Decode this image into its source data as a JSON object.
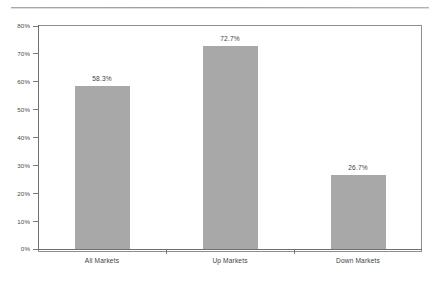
{
  "chart_data": {
    "type": "bar",
    "title": "",
    "subtitle": "",
    "xlabel": "",
    "ylabel": "",
    "categories": [
      "All Markets",
      "Up Markets",
      "Down Markets"
    ],
    "values": [
      58.3,
      72.7,
      26.7
    ],
    "value_labels": [
      "58.3%",
      "72.7%",
      "26.7%"
    ],
    "ylim": [
      0,
      80
    ],
    "ytick_values": [
      0,
      10,
      20,
      30,
      40,
      50,
      60,
      70,
      80
    ],
    "ytick_labels": [
      "0%",
      "10%",
      "20%",
      "30%",
      "40%",
      "50%",
      "60%",
      "70%",
      "80%"
    ],
    "grid": false,
    "legend": false,
    "legend_position": "none",
    "bar_color": "#a8a8a8",
    "axis_color": "#6f6f6f",
    "frame_color": "#8e8e8e",
    "background_color": "#ffffff"
  }
}
